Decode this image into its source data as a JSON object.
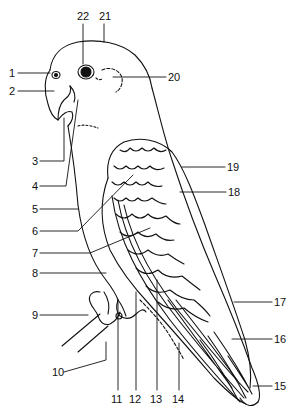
{
  "diagram": {
    "stroke_color": "#111111",
    "background_color": "#ffffff",
    "labels": [
      {
        "n": "1",
        "x": 9,
        "y": 68
      },
      {
        "n": "2",
        "x": 9,
        "y": 87
      },
      {
        "n": "3",
        "x": 32,
        "y": 156
      },
      {
        "n": "4",
        "x": 32,
        "y": 181
      },
      {
        "n": "5",
        "x": 32,
        "y": 204
      },
      {
        "n": "6",
        "x": 32,
        "y": 226
      },
      {
        "n": "7",
        "x": 32,
        "y": 248
      },
      {
        "n": "8",
        "x": 32,
        "y": 268
      },
      {
        "n": "9",
        "x": 32,
        "y": 311
      },
      {
        "n": "10",
        "x": 52,
        "y": 368
      },
      {
        "n": "11",
        "x": 111,
        "y": 394
      },
      {
        "n": "12",
        "x": 129,
        "y": 394
      },
      {
        "n": "13",
        "x": 150,
        "y": 394
      },
      {
        "n": "14",
        "x": 172,
        "y": 394
      },
      {
        "n": "15",
        "x": 274,
        "y": 382
      },
      {
        "n": "16",
        "x": 274,
        "y": 335
      },
      {
        "n": "17",
        "x": 274,
        "y": 298
      },
      {
        "n": "18",
        "x": 228,
        "y": 187
      },
      {
        "n": "19",
        "x": 227,
        "y": 162
      },
      {
        "n": "20",
        "x": 168,
        "y": 73
      },
      {
        "n": "21",
        "x": 99,
        "y": 11
      },
      {
        "n": "22",
        "x": 77,
        "y": 11
      }
    ]
  }
}
